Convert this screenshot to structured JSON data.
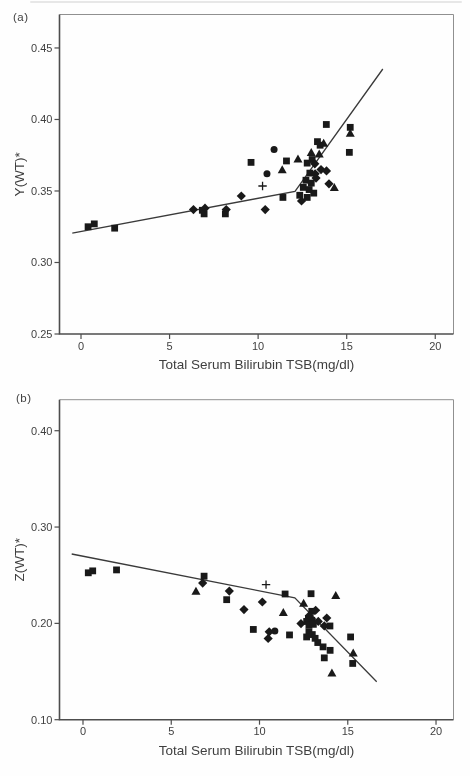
{
  "colors": {
    "marker": "#191919",
    "line": "#3a3a3a",
    "frame": "#909090",
    "axis": "#4d4d4d",
    "text": "#3f3f3f",
    "background": "#fefefe"
  },
  "chart_data": [
    {
      "panel": "a",
      "panel_label": "(a)",
      "type": "scatter",
      "xlabel": "Total Serum Bilirubin TSB(mg/dl)",
      "ylabel": "Y(WT)*",
      "xlim": [
        -1.214,
        21.03
      ],
      "ylim": [
        0.25,
        0.4734
      ],
      "xticks": [
        0,
        5,
        10,
        15,
        20
      ],
      "xtick_labels": [
        "0",
        "5",
        "10",
        "15",
        "20"
      ],
      "yticks": [
        0.25,
        0.3,
        0.35,
        0.4,
        0.45
      ],
      "ytick_labels": [
        "0.25",
        "0.30",
        "0.35",
        "0.40",
        "0.45"
      ],
      "grid": false,
      "legend": "none",
      "regression_line": [
        [
          -0.49,
          0.3205
        ],
        [
          12.08,
          0.3497
        ],
        [
          17.04,
          0.4353
        ]
      ],
      "series": [
        {
          "name": "group-square",
          "marker": "square",
          "points": [
            [
              0.4,
              0.325
            ],
            [
              0.75,
              0.327
            ],
            [
              1.9,
              0.324
            ],
            [
              6.85,
              0.3365
            ],
            [
              6.95,
              0.334
            ],
            [
              8.15,
              0.334
            ],
            [
              9.6,
              0.37
            ],
            [
              11.4,
              0.3455
            ],
            [
              11.6,
              0.371
            ],
            [
              12.35,
              0.347
            ],
            [
              12.55,
              0.3525
            ],
            [
              12.7,
              0.3575
            ],
            [
              12.77,
              0.3695
            ],
            [
              12.77,
              0.3455
            ],
            [
              12.88,
              0.351
            ],
            [
              12.92,
              0.3625
            ],
            [
              13.0,
              0.3555
            ],
            [
              13.05,
              0.372
            ],
            [
              13.14,
              0.3485
            ],
            [
              13.35,
              0.3845
            ],
            [
              13.5,
              0.382
            ],
            [
              13.85,
              0.3965
            ],
            [
              15.2,
              0.3945
            ],
            [
              15.15,
              0.377
            ]
          ]
        },
        {
          "name": "group-diamond",
          "marker": "diamond",
          "points": [
            [
              6.35,
              0.337
            ],
            [
              7.0,
              0.338
            ],
            [
              8.2,
              0.337
            ],
            [
              9.05,
              0.3465
            ],
            [
              10.4,
              0.337
            ],
            [
              12.45,
              0.343
            ],
            [
              13.2,
              0.369
            ],
            [
              13.22,
              0.362
            ],
            [
              13.27,
              0.359
            ],
            [
              13.55,
              0.365
            ],
            [
              13.86,
              0.364
            ],
            [
              14.0,
              0.355
            ]
          ]
        },
        {
          "name": "group-triangle",
          "marker": "triangle",
          "points": [
            [
              11.36,
              0.365
            ],
            [
              12.25,
              0.3725
            ],
            [
              13.0,
              0.377
            ],
            [
              13.45,
              0.376
            ],
            [
              13.7,
              0.3835
            ],
            [
              14.3,
              0.3525
            ],
            [
              15.2,
              0.3905
            ]
          ]
        },
        {
          "name": "group-circle",
          "marker": "circle",
          "points": [
            [
              10.5,
              0.362
            ],
            [
              10.9,
              0.379
            ]
          ]
        },
        {
          "name": "group-plus",
          "marker": "plus",
          "points": [
            [
              10.25,
              0.3535
            ]
          ]
        }
      ]
    },
    {
      "panel": "b",
      "panel_label": "(b)",
      "type": "scatter",
      "xlabel": "Total Serum Bilirubin TSB(mg/dl)",
      "ylabel": "Z(WT)*",
      "xlim": [
        -1.331,
        20.99
      ],
      "ylim": [
        0.1,
        0.4322
      ],
      "xticks": [
        0,
        5,
        10,
        15,
        20
      ],
      "xtick_labels": [
        "0",
        "5",
        "10",
        "15",
        "20"
      ],
      "yticks": [
        0.1,
        0.2,
        0.3,
        0.4
      ],
      "ytick_labels": [
        "0.10",
        "0.20",
        "0.30",
        "0.40"
      ],
      "grid": false,
      "legend": "none",
      "regression_line": [
        [
          -0.64,
          0.272
        ],
        [
          12.0,
          0.2265
        ],
        [
          16.64,
          0.1394
        ]
      ],
      "series": [
        {
          "name": "group-square",
          "marker": "square",
          "points": [
            [
              0.3,
              0.2525
            ],
            [
              0.55,
              0.2545
            ],
            [
              1.9,
              0.2555
            ],
            [
              6.86,
              0.249
            ],
            [
              8.14,
              0.2246
            ],
            [
              9.65,
              0.1937
            ],
            [
              11.45,
              0.2305
            ],
            [
              11.7,
              0.188
            ],
            [
              12.92,
              0.2308
            ],
            [
              12.67,
              0.202
            ],
            [
              12.77,
              0.205
            ],
            [
              12.96,
              0.2125
            ],
            [
              12.96,
              0.2032
            ],
            [
              12.8,
              0.198
            ],
            [
              13.05,
              0.199
            ],
            [
              12.8,
              0.1911
            ],
            [
              12.99,
              0.1884
            ],
            [
              12.67,
              0.1859
            ],
            [
              13.15,
              0.1845
            ],
            [
              13.3,
              0.1801
            ],
            [
              13.6,
              0.1756
            ],
            [
              13.99,
              0.1973
            ],
            [
              14.0,
              0.172
            ],
            [
              13.67,
              0.1642
            ],
            [
              15.16,
              0.1859
            ],
            [
              15.28,
              0.1584
            ]
          ]
        },
        {
          "name": "group-diamond",
          "marker": "diamond",
          "points": [
            [
              6.78,
              0.2418
            ],
            [
              8.29,
              0.2335
            ],
            [
              9.12,
              0.2143
            ],
            [
              10.16,
              0.2222
            ],
            [
              10.55,
              0.1912
            ],
            [
              10.49,
              0.1843
            ],
            [
              12.35,
              0.1998
            ],
            [
              12.82,
              0.208
            ],
            [
              13.18,
              0.2136
            ],
            [
              13.33,
              0.202
            ],
            [
              13.67,
              0.1973
            ],
            [
              13.81,
              0.2056
            ]
          ]
        },
        {
          "name": "group-triangle",
          "marker": "triangle",
          "points": [
            [
              6.4,
              0.2335
            ],
            [
              11.35,
              0.2115
            ],
            [
              12.5,
              0.221
            ],
            [
              14.32,
              0.2291
            ],
            [
              14.1,
              0.1487
            ],
            [
              15.31,
              0.1693
            ]
          ]
        },
        {
          "name": "group-circle",
          "marker": "circle",
          "points": [
            [
              10.87,
              0.1922
            ]
          ]
        },
        {
          "name": "group-plus",
          "marker": "plus",
          "points": [
            [
              10.37,
              0.2402
            ]
          ]
        }
      ]
    }
  ]
}
